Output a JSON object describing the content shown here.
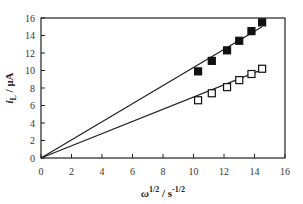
{
  "chart_data": {
    "type": "scatter",
    "title": "",
    "xlabel": "ω^1/2 / s^-1/2",
    "ylabel": "i_L / μA",
    "xlim": [
      0,
      16
    ],
    "ylim": [
      0,
      16
    ],
    "xticks": [
      0,
      2,
      4,
      6,
      8,
      10,
      12,
      14,
      16
    ],
    "yticks": [
      0,
      2,
      4,
      6,
      8,
      10,
      12,
      14,
      16
    ],
    "grid": false,
    "legend": null,
    "series": [
      {
        "name": "filled squares",
        "marker": "filled-square",
        "x": [
          10.3,
          11.2,
          12.2,
          13.0,
          13.8,
          14.5
        ],
        "y": [
          9.9,
          11.1,
          12.3,
          13.4,
          14.5,
          15.5
        ],
        "fit_line": {
          "x": [
            0,
            14.5
          ],
          "y": [
            0,
            15.0
          ]
        }
      },
      {
        "name": "open squares",
        "marker": "open-square",
        "x": [
          10.3,
          11.2,
          12.2,
          13.0,
          13.8,
          14.5
        ],
        "y": [
          6.6,
          7.4,
          8.1,
          8.9,
          9.6,
          10.2
        ],
        "fit_line": {
          "x": [
            0,
            14.5
          ],
          "y": [
            0,
            10.1
          ]
        }
      }
    ]
  },
  "axes": {
    "x_title_main": "ω",
    "x_title_sup1": "1/2",
    "x_title_mid": " / s",
    "x_title_sup2": "-1/2",
    "y_title_main": "i",
    "y_title_sub": "L",
    "y_title_unit": " / μA"
  }
}
